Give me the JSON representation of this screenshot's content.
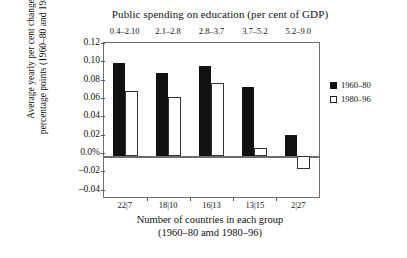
{
  "chart_data": {
    "type": "bar",
    "title": "Public spending on education (per cent of GDP)",
    "xlabel": "Number of countries in each group",
    "xlabel_line2": "(1960–80 amd 1980–96)",
    "ylabel": "Average yearly per cent change in percentage points (1960–80 and 1980–96)",
    "categories": [
      "22|7",
      "18|10",
      "16|13",
      "13|15",
      "2|27"
    ],
    "top_categories": [
      "0.4–2.10",
      "2.1–2.8",
      "2.8–3.7",
      "3.7–5.2",
      "5.2–9.0"
    ],
    "series": [
      {
        "name": "1960–80",
        "values": [
          0.103,
          0.092,
          0.1,
          0.076,
          0.023
        ],
        "color": "#111111"
      },
      {
        "name": "1980–96",
        "values": [
          0.072,
          0.065,
          0.081,
          0.009,
          -0.014
        ],
        "color": "#ffffff"
      }
    ],
    "ylim": [
      -0.045,
      0.125
    ],
    "yticks": [
      0.12,
      0.1,
      0.08,
      0.06,
      0.04,
      0.02,
      0.0,
      -0.02,
      -0.04
    ],
    "ytick_labels": [
      "0.12",
      "0.10",
      "0.08",
      "0.06",
      "0.04",
      "0.02",
      "0.0%",
      "–0.02",
      "–0.04"
    ],
    "grid": false,
    "legend_position": "right",
    "zero_line": 0.0
  },
  "legend": {
    "entries": [
      {
        "label": "1960–80",
        "swatch": "filled-square"
      },
      {
        "label": "1980–96",
        "swatch": "open-square"
      }
    ]
  },
  "colors": {
    "series_1": "#111111",
    "series_2": "#ffffff",
    "frame": "#6d6d6d",
    "background": "#ffffff"
  }
}
